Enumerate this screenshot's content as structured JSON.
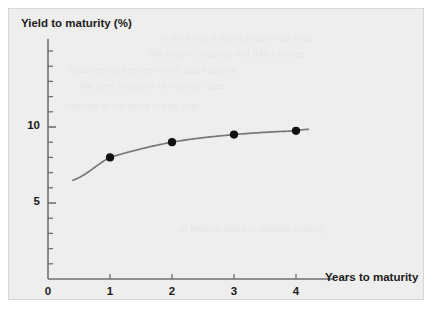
{
  "figure": {
    "background_color": "#eeeeee",
    "border_color": "#d6d6d6",
    "curve_color": "#777777",
    "marker_color": "#111111",
    "axis_color": "#6f6f6f",
    "text_color": "#1b1b1b"
  },
  "chart_data": {
    "type": "line",
    "title": "",
    "xlabel": "Years to maturity",
    "ylabel": "Yield to maturity (%)",
    "xlim": [
      0,
      4.6
    ],
    "ylim": [
      0,
      15.8
    ],
    "grid": false,
    "legend": "none",
    "x_ticks": [
      0,
      1,
      2,
      3,
      4
    ],
    "x_tick_labels": [
      "0",
      "1",
      "2",
      "3",
      "4"
    ],
    "y_major_ticks": [
      5,
      10
    ],
    "y_major_tick_labels": [
      "5",
      "10"
    ],
    "y_minor_ticks": [
      1,
      2,
      3,
      4,
      6,
      7,
      8,
      9,
      11,
      12,
      13,
      14,
      15
    ],
    "series": [
      {
        "name": "Yield curve",
        "x": [
          1,
          2,
          3,
          4
        ],
        "values": [
          8.0,
          9.0,
          9.5,
          9.75
        ],
        "marker": "circle",
        "curve_x_start": 0.4,
        "curve_x_end": 4.2,
        "curve_y_start": 6.5,
        "curve_y_end": 9.85
      }
    ]
  },
  "background_ghost_text": [
    "of the bond is the discount rate that",
    "the yield to maturity will differ across",
    "relationship between yield and maturity",
    "the term structure of interest rates",
    "maturity of the bond is one year",
    "of interest rates is upward sloping"
  ]
}
